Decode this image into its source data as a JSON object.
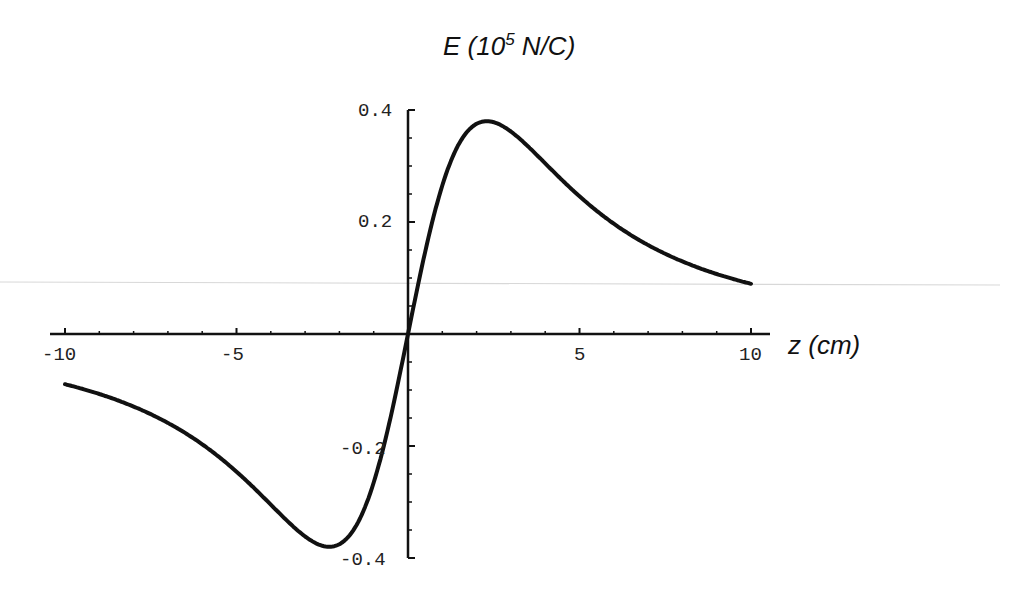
{
  "chart_data": {
    "type": "line",
    "title_parts": {
      "prefix": "E (10",
      "sup": "5",
      "suffix": " N/C)"
    },
    "xlabel": "z (cm)",
    "ylabel": "E (10^5 N/C)",
    "xlim": [
      -10,
      10
    ],
    "ylim": [
      -0.4,
      0.4
    ],
    "grid": false,
    "legend": null,
    "x_ticks": [
      -10,
      -5,
      5,
      10
    ],
    "x_tick_labels": [
      "-10",
      "-5",
      "5",
      "10"
    ],
    "y_ticks": [
      0.4,
      0.2,
      -0.2,
      -0.4
    ],
    "y_tick_labels": [
      "0.4",
      "0.2",
      "-0.2",
      "-0.4"
    ],
    "series": [
      {
        "name": "E(z)",
        "x": [
          -10,
          -9,
          -8,
          -7,
          -6,
          -5,
          -4,
          -3,
          -2.3,
          -2,
          -1,
          0,
          1,
          2,
          2.3,
          3,
          4,
          5,
          6,
          7,
          8,
          9,
          10
        ],
        "values": [
          -0.072,
          -0.091,
          -0.117,
          -0.152,
          -0.199,
          -0.26,
          -0.327,
          -0.373,
          -0.38,
          -0.378,
          -0.274,
          0.0,
          0.274,
          0.378,
          0.38,
          0.373,
          0.327,
          0.26,
          0.199,
          0.152,
          0.117,
          0.091,
          0.072
        ]
      }
    ]
  },
  "axes": {
    "x_tick_labels": [
      "-10",
      "-5",
      "5",
      "10"
    ],
    "y_tick_labels": [
      "0.4",
      "0.2",
      "-0.2",
      "-0.4"
    ]
  },
  "labels": {
    "title_prefix": "E (10",
    "title_sup": "5",
    "title_suffix": " N/C)",
    "xlabel": "z (cm)"
  }
}
